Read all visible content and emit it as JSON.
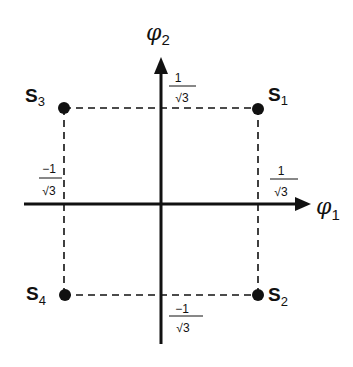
{
  "diagram": {
    "type": "state-space-plot",
    "axes": {
      "x": {
        "label": "φ",
        "subscript": "1"
      },
      "y": {
        "label": "φ",
        "subscript": "2"
      }
    },
    "tick_labels": {
      "x_positive": {
        "numerator": "1",
        "denominator": "√3"
      },
      "x_negative": {
        "numerator": "−1",
        "denominator": "√3"
      },
      "y_positive": {
        "numerator": "1",
        "denominator": "√3"
      },
      "y_negative": {
        "numerator": "−1",
        "denominator": "√3"
      }
    },
    "states": [
      {
        "name": "S",
        "subscript": "1",
        "position": "upper-right",
        "phi1": "1/√3",
        "phi2": "1/√3"
      },
      {
        "name": "S",
        "subscript": "2",
        "position": "lower-right",
        "phi1": "1/√3",
        "phi2": "−1/√3"
      },
      {
        "name": "S",
        "subscript": "3",
        "position": "upper-left",
        "phi1": "−1/√3",
        "phi2": "1/√3"
      },
      {
        "name": "S",
        "subscript": "4",
        "position": "lower-left",
        "phi1": "−1/√3",
        "phi2": "−1/√3"
      }
    ],
    "colors": {
      "ink": "#111111",
      "background": "#ffffff"
    }
  }
}
